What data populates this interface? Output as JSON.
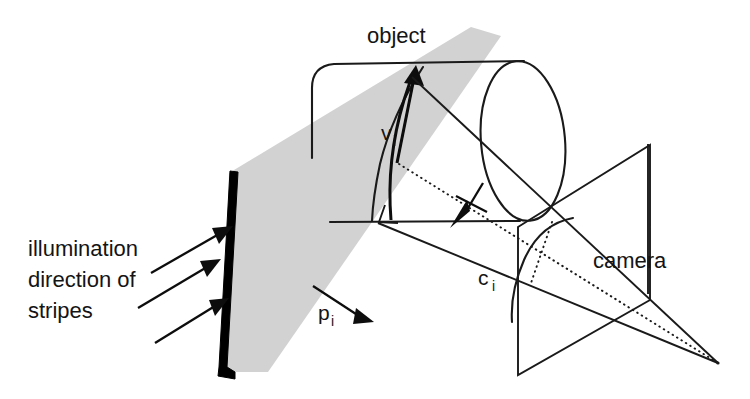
{
  "figure": {
    "background_color": "#ffffff",
    "ink_color": "#1a1a1a",
    "light_plane_color": "#d2d2d2",
    "slit_color": "#000000",
    "width": 750,
    "height": 399
  },
  "labels": {
    "object": "object",
    "camera": "camera",
    "illumination_line1": "illumination",
    "illumination_line2": "direction of",
    "illumination_line3": "stripes",
    "vector_v": "v",
    "vector_v_sub": "i",
    "vector_c": "c",
    "vector_c_sub": "i",
    "vector_p": "p",
    "vector_p_sub": "i"
  },
  "elements": {
    "light_plane_name": "illumination-light-plane",
    "slit_name": "stripe-slit-bar",
    "object_name": "cylinder-object",
    "camera_name": "camera-image-plane",
    "projection_center_name": "camera-projection-center",
    "stripe_curve_name": "projected-stripe-on-object",
    "image_stripe_name": "stripe-image-on-sensor"
  }
}
